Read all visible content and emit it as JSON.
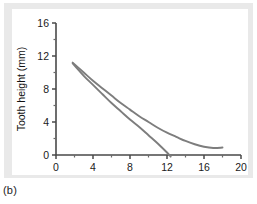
{
  "figure": {
    "caption": "(b)",
    "panel_background": "#ffffff",
    "card_background": "#e9e9e9"
  },
  "chart_data": {
    "type": "line",
    "title": "",
    "xlabel": "Age (years)",
    "ylabel": "Tooth height (mm)",
    "xlim": [
      0,
      20
    ],
    "ylim": [
      0,
      16
    ],
    "xticks": [
      0,
      4,
      8,
      12,
      16,
      20
    ],
    "yticks": [
      0,
      4,
      8,
      12,
      16
    ],
    "xtick_labels": [
      "0",
      "4",
      "8",
      "12",
      "16",
      "20"
    ],
    "ytick_labels": [
      "0",
      "4",
      "8",
      "12",
      "16"
    ],
    "minor_ticks": true,
    "x_minor_ticks": [
      2,
      6,
      10,
      14,
      18
    ],
    "y_minor_ticks": [
      2,
      6,
      10,
      14
    ],
    "grid": false,
    "legend": null,
    "series_color": "#7d7d7d",
    "series": [
      {
        "name": "upper-curve",
        "x": [
          1.8,
          3.0,
          4.0,
          5.0,
          6.0,
          7.0,
          8.0,
          9.0,
          10.0,
          11.0,
          12.0,
          13.0,
          14.0,
          15.0,
          16.0,
          17.0,
          18.0
        ],
        "y": [
          11.2,
          10.0,
          9.0,
          8.1,
          7.2,
          6.3,
          5.5,
          4.7,
          4.0,
          3.3,
          2.7,
          2.2,
          1.7,
          1.3,
          1.0,
          0.85,
          0.9
        ]
      },
      {
        "name": "lower-curve",
        "x": [
          1.8,
          3.0,
          4.0,
          5.0,
          6.0,
          7.0,
          8.0,
          9.0,
          10.0,
          11.0,
          12.0,
          12.4
        ],
        "y": [
          11.1,
          9.6,
          8.5,
          7.4,
          6.3,
          5.3,
          4.3,
          3.4,
          2.4,
          1.4,
          0.3,
          -0.2
        ]
      }
    ]
  }
}
